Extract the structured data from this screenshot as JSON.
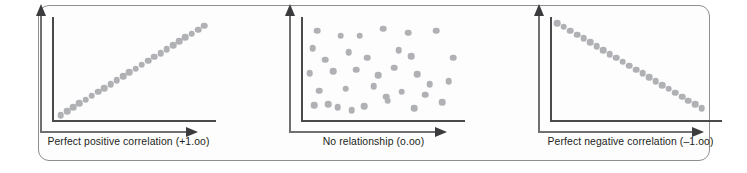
{
  "figure": {
    "panel_count": 3,
    "frame_color": "#8e8f92",
    "axis_color_inner": "#4a4a4c",
    "axis_color_outer": "#6f7072",
    "dot_color": "#b0b1b4",
    "caption_color": "#231f20",
    "background": "#ffffff"
  },
  "panels": [
    {
      "id": "perfect-positive",
      "caption": "Perfect positive correlation (+1.oo)",
      "axis": {
        "x_arrow": "right-arrow-icon",
        "y_arrow": "up-arrow-icon"
      }
    },
    {
      "id": "no-relationship",
      "caption": "No relationship (o.oo)",
      "axis": {
        "x_arrow": "right-arrow-icon",
        "y_arrow": "up-arrow-icon"
      }
    },
    {
      "id": "perfect-negative",
      "caption": "Perfect negative correlation (–1.oo)",
      "axis": {
        "x_arrow": "right-arrow-icon",
        "y_arrow": "up-arrow-icon"
      }
    }
  ],
  "chart_data": [
    {
      "type": "scatter",
      "title": "Perfect positive correlation (+1.oo)",
      "correlation": 1.0,
      "xlabel": "",
      "ylabel": "",
      "xlim": [
        0,
        100
      ],
      "ylim": [
        0,
        100
      ],
      "grid": false,
      "legend": "none",
      "x": [
        3,
        7,
        11,
        15,
        19,
        23,
        27,
        31,
        35,
        39,
        43,
        47,
        51,
        55,
        59,
        63,
        67,
        71,
        75,
        79,
        83,
        87,
        91,
        95
      ],
      "y": [
        3,
        7,
        11,
        15,
        19,
        23,
        27,
        31,
        35,
        39,
        43,
        47,
        51,
        55,
        59,
        63,
        67,
        71,
        75,
        79,
        83,
        87,
        91,
        95
      ]
    },
    {
      "type": "scatter",
      "title": "No relationship (o.oo)",
      "correlation": 0.0,
      "xlabel": "",
      "ylabel": "",
      "xlim": [
        0,
        100
      ],
      "ylim": [
        0,
        100
      ],
      "grid": false,
      "legend": "none",
      "x": [
        8,
        23,
        35,
        50,
        5,
        28,
        60,
        13,
        40,
        68,
        3,
        18,
        33,
        47,
        57,
        72,
        9,
        26,
        44,
        62,
        80,
        15,
        38,
        53,
        70,
        88,
        6,
        30,
        52,
        77,
        92,
        84,
        95,
        66,
        21
      ],
      "y": [
        90,
        85,
        85,
        92,
        72,
        68,
        70,
        60,
        62,
        64,
        46,
        48,
        50,
        44,
        52,
        45,
        28,
        30,
        33,
        27,
        35,
        14,
        12,
        18,
        10,
        16,
        13,
        8,
        22,
        24,
        38,
        90,
        62,
        88,
        11
      ]
    },
    {
      "type": "scatter",
      "title": "Perfect negative correlation (–1.oo)",
      "correlation": -1.0,
      "xlabel": "",
      "ylabel": "",
      "xlim": [
        0,
        100
      ],
      "ylim": [
        0,
        100
      ],
      "grid": false,
      "legend": "none",
      "x": [
        2,
        6,
        10,
        14,
        18,
        22,
        26,
        30,
        34,
        38,
        42,
        46,
        50,
        54,
        58,
        62,
        66,
        70,
        74,
        78,
        82,
        86,
        90
      ],
      "y": [
        98,
        94,
        90,
        86,
        82,
        78,
        74,
        70,
        66,
        62,
        58,
        54,
        50,
        46,
        42,
        38,
        34,
        30,
        26,
        22,
        18,
        14,
        10
      ]
    }
  ]
}
